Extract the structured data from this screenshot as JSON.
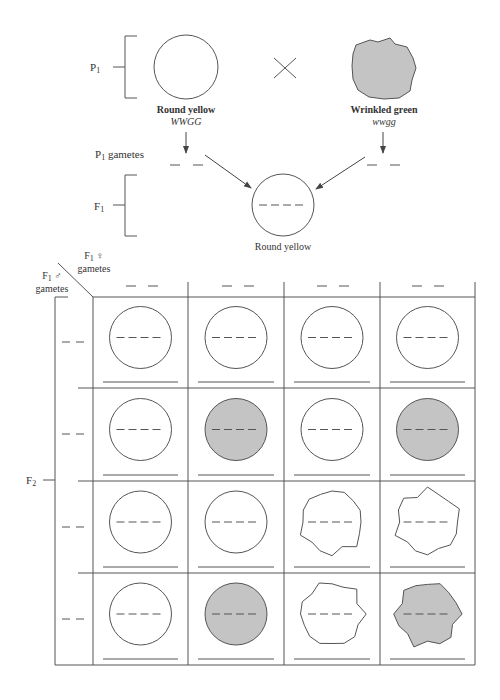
{
  "generations": {
    "p1": {
      "label": "P",
      "sub": "1"
    },
    "f1": {
      "label": "F",
      "sub": "1"
    },
    "f2": {
      "label": "F",
      "sub": "2"
    }
  },
  "parents": [
    {
      "phenotype": "Round yellow",
      "genotype": "WWGG",
      "shape": "round",
      "color": "yellow",
      "filled": false
    },
    {
      "phenotype": "Wrinkled green",
      "genotype": "wwgg",
      "shape": "wrinkled",
      "color": "green",
      "filled": true
    }
  ],
  "cross_symbol": "×",
  "p1_gametes_label": "P",
  "p1_gametes_sub": "1",
  "p1_gametes_suffix": " gametes",
  "f1_offspring": {
    "phenotype": "Round yellow",
    "shape": "round",
    "filled": false
  },
  "punnett": {
    "female_label": "F",
    "female_sub": "1",
    "female_symbol": "♀",
    "male_label": "F",
    "male_sub": "1",
    "male_symbol": "♂",
    "gametes_word": "gametes",
    "female_gametes": [
      "_ _",
      "_ _",
      "_ _",
      "_ _"
    ],
    "male_gametes": [
      "_ _",
      "_ _",
      "_ _",
      "_ _"
    ],
    "cells": [
      [
        {
          "shape": "round",
          "filled": false
        },
        {
          "shape": "round",
          "filled": false
        },
        {
          "shape": "round",
          "filled": false
        },
        {
          "shape": "round",
          "filled": false
        }
      ],
      [
        {
          "shape": "round",
          "filled": false
        },
        {
          "shape": "round",
          "filled": true
        },
        {
          "shape": "round",
          "filled": false
        },
        {
          "shape": "round",
          "filled": true
        }
      ],
      [
        {
          "shape": "round",
          "filled": false
        },
        {
          "shape": "round",
          "filled": false
        },
        {
          "shape": "wrinkled",
          "filled": false
        },
        {
          "shape": "wrinkled",
          "filled": false
        }
      ],
      [
        {
          "shape": "round",
          "filled": false
        },
        {
          "shape": "round",
          "filled": true
        },
        {
          "shape": "wrinkled",
          "filled": false
        },
        {
          "shape": "wrinkled",
          "filled": true
        }
      ]
    ]
  },
  "colors": {
    "line": "#555555",
    "fill_green": "#c4c4c4",
    "background": "#ffffff"
  }
}
